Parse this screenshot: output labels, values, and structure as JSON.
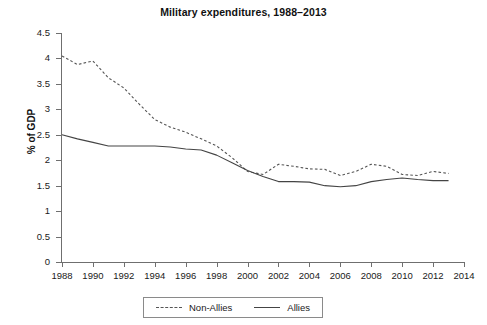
{
  "chart_data": {
    "type": "line",
    "title": "Military expenditures, 1988–2013",
    "xlabel": "",
    "ylabel": "% of GDP",
    "xlim": [
      1988,
      2014
    ],
    "ylim": [
      0,
      4.5
    ],
    "grid": false,
    "legend_position": "bottom-center",
    "x_tick_labels": [
      "1988",
      "1990",
      "1992",
      "1994",
      "1996",
      "1998",
      "2000",
      "2002",
      "2004",
      "2006",
      "2008",
      "2010",
      "2012",
      "2014"
    ],
    "x_tick_values": [
      1988,
      1990,
      1992,
      1994,
      1996,
      1998,
      2000,
      2002,
      2004,
      2006,
      2008,
      2010,
      2012,
      2014
    ],
    "y_tick_labels": [
      "0",
      "0.5",
      "1",
      "1.5",
      "2",
      "2.5",
      "3",
      "3.5",
      "4",
      "4.5"
    ],
    "y_tick_values": [
      0,
      0.5,
      1,
      1.5,
      2,
      2.5,
      3,
      3.5,
      4,
      4.5
    ],
    "x": [
      1988,
      1989,
      1990,
      1991,
      1992,
      1993,
      1994,
      1995,
      1996,
      1997,
      1998,
      1999,
      2000,
      2001,
      2002,
      2003,
      2004,
      2005,
      2006,
      2007,
      2008,
      2009,
      2010,
      2011,
      2012,
      2013
    ],
    "series": [
      {
        "name": "Non-Allies",
        "style": "dashed",
        "color": "#555555",
        "values": [
          4.05,
          3.88,
          3.95,
          3.62,
          3.42,
          3.1,
          2.8,
          2.65,
          2.55,
          2.42,
          2.28,
          2.05,
          1.78,
          1.72,
          1.92,
          1.88,
          1.83,
          1.82,
          1.7,
          1.78,
          1.92,
          1.88,
          1.72,
          1.7,
          1.78,
          1.74
        ]
      },
      {
        "name": "Allies",
        "style": "solid",
        "color": "#444444",
        "values": [
          2.5,
          2.42,
          2.35,
          2.28,
          2.28,
          2.28,
          2.28,
          2.26,
          2.22,
          2.2,
          2.1,
          1.95,
          1.8,
          1.68,
          1.58,
          1.58,
          1.57,
          1.5,
          1.48,
          1.5,
          1.58,
          1.62,
          1.65,
          1.62,
          1.6,
          1.6
        ]
      }
    ]
  },
  "legend": {
    "items": [
      {
        "label": "Non-Allies",
        "style": "dashed"
      },
      {
        "label": "Allies",
        "style": "solid"
      }
    ]
  }
}
